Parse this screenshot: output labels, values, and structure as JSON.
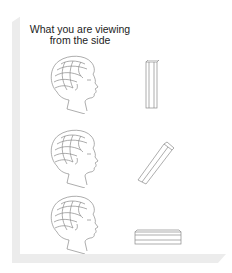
{
  "title": {
    "line1": "What you are viewing",
    "line2": "from the side"
  },
  "rows": [
    {
      "head": "woman-profile-head",
      "object": "vertical-bar",
      "orientation": "vertical"
    },
    {
      "head": "woman-profile-head",
      "object": "tilted-bar",
      "orientation": "diagonal"
    },
    {
      "head": "woman-profile-head",
      "object": "horizontal-bar",
      "orientation": "horizontal"
    }
  ],
  "colors": {
    "line": "#8a8a8a",
    "shadow": "#ececec",
    "background": "#ffffff"
  }
}
